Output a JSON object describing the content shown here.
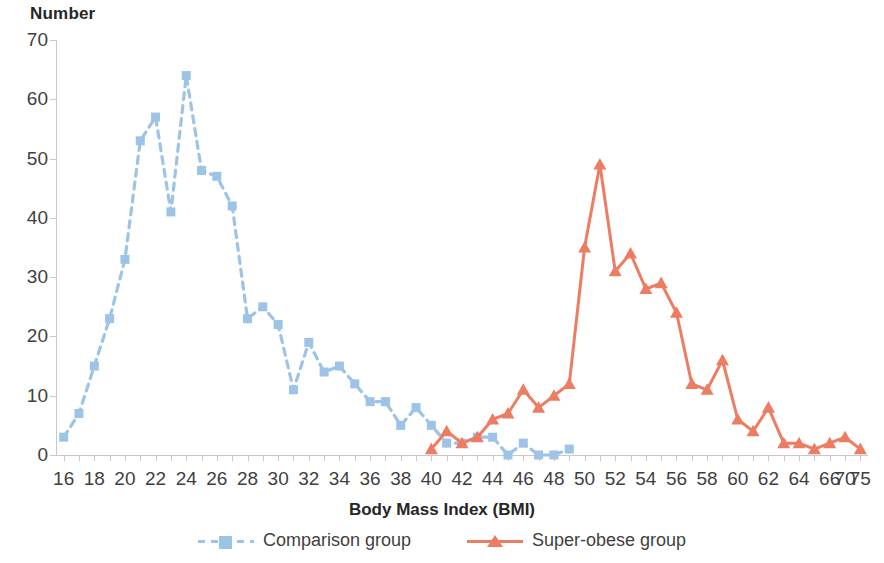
{
  "chart_data": {
    "type": "line",
    "title": "",
    "xlabel": "Body Mass Index (BMI)",
    "ylabel": "Number",
    "ylim": [
      0,
      70
    ],
    "ytick_step": 10,
    "yticks": [
      0,
      10,
      20,
      30,
      40,
      50,
      60,
      70
    ],
    "xticks": [
      16,
      17,
      18,
      19,
      20,
      21,
      22,
      23,
      24,
      25,
      26,
      27,
      28,
      29,
      30,
      31,
      32,
      33,
      34,
      35,
      36,
      37,
      38,
      39,
      40,
      41,
      42,
      43,
      44,
      45,
      46,
      47,
      48,
      49,
      50,
      51,
      52,
      53,
      54,
      55,
      56,
      57,
      58,
      59,
      60,
      61,
      62,
      63,
      64,
      65,
      66,
      70,
      75
    ],
    "xtick_labels": [
      "16",
      "",
      "18",
      "",
      "20",
      "",
      "22",
      "",
      "24",
      "",
      "26",
      "",
      "28",
      "",
      "30",
      "",
      "32",
      "",
      "34",
      "",
      "36",
      "",
      "38",
      "",
      "40",
      "",
      "42",
      "",
      "44",
      "",
      "46",
      "",
      "48",
      "",
      "50",
      "",
      "52",
      "",
      "54",
      "",
      "56",
      "",
      "58",
      "",
      "60",
      "",
      "62",
      "",
      "64",
      "",
      "66",
      "70",
      "75"
    ],
    "grid": false,
    "legend_position": "bottom",
    "colors": {
      "comparison": "#9DC3E6",
      "super_obese": "#ED7D62"
    },
    "series": [
      {
        "name": "Comparison group",
        "color": "#9DC3E6",
        "line_style": "dashed",
        "marker": "square",
        "x": [
          16,
          17,
          18,
          19,
          20,
          21,
          22,
          23,
          24,
          25,
          26,
          27,
          28,
          29,
          30,
          31,
          32,
          33,
          34,
          35,
          36,
          37,
          38,
          39,
          40,
          41,
          42,
          43,
          44,
          45,
          46,
          47,
          48,
          49
        ],
        "values": [
          3,
          7,
          15,
          23,
          33,
          53,
          57,
          41,
          64,
          48,
          47,
          42,
          23,
          25,
          22,
          11,
          19,
          14,
          15,
          12,
          9,
          9,
          5,
          8,
          5,
          2,
          2,
          3,
          3,
          0,
          2,
          0,
          0,
          1
        ]
      },
      {
        "name": "Super-obese group",
        "color": "#ED7D62",
        "line_style": "solid",
        "marker": "triangle",
        "x": [
          40,
          41,
          42,
          43,
          44,
          45,
          46,
          47,
          48,
          49,
          50,
          51,
          52,
          53,
          54,
          55,
          56,
          57,
          58,
          59,
          60,
          61,
          62,
          63,
          64,
          65,
          66,
          70,
          75
        ],
        "values": [
          1,
          4,
          2,
          3,
          6,
          7,
          11,
          8,
          10,
          12,
          35,
          49,
          31,
          34,
          28,
          29,
          24,
          12,
          11,
          16,
          6,
          4,
          8,
          2,
          2,
          1,
          2,
          3,
          1
        ]
      }
    ]
  },
  "legend": {
    "items": [
      {
        "label": "Comparison group",
        "color": "#9DC3E6",
        "style": "dashed",
        "marker": "square"
      },
      {
        "label": "Super-obese group",
        "color": "#ED7D62",
        "style": "solid",
        "marker": "triangle"
      }
    ]
  }
}
